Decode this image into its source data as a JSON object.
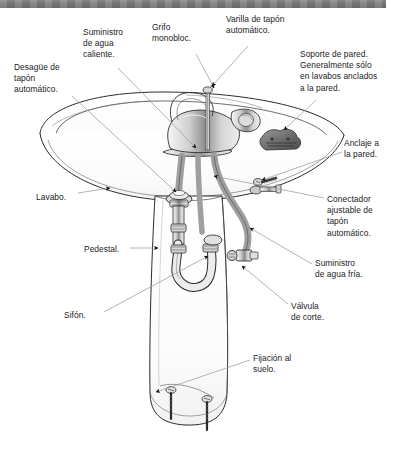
{
  "document": {
    "type": "technical-illustration",
    "subject": "Lavabo con pedestal",
    "language": "es",
    "header_band_color": "#797979",
    "line_color": "#8d8d8d",
    "ink_color": "#1b1b1b"
  },
  "labels": [
    {
      "id": "desague",
      "text": "Desagüe de\ntapón\nautomático.",
      "x": 14,
      "y": 62
    },
    {
      "id": "suministro_caliente",
      "text": "Suministro\nde agua\ncaliente.",
      "x": 83,
      "y": 27
    },
    {
      "id": "grifo",
      "text": "Grifo\nmonobloc.",
      "x": 152,
      "y": 22
    },
    {
      "id": "varilla",
      "text": "Varilla de tapón\nautomático.",
      "x": 226,
      "y": 14
    },
    {
      "id": "soporte",
      "text": "Soporte de pared.\nGeneralmente sólo\nen lavabos anclados\na la pared.",
      "x": 300,
      "y": 49
    },
    {
      "id": "anclaje",
      "text": "Anclaje a\nla pared.",
      "x": 344,
      "y": 138
    },
    {
      "id": "lavabo",
      "text": "Lavabo.",
      "x": 36,
      "y": 192
    },
    {
      "id": "conectador",
      "text": "Conectador\najustable de\ntapón\nautomático.",
      "x": 327,
      "y": 194
    },
    {
      "id": "pedestal",
      "text": "Pedestal.",
      "x": 84,
      "y": 244
    },
    {
      "id": "suministro_fria",
      "text": "Suministro\nde agua fría.",
      "x": 315,
      "y": 258
    },
    {
      "id": "valvula",
      "text": "Válvula\nde corte.",
      "x": 291,
      "y": 301
    },
    {
      "id": "sifon",
      "text": "Sifón.",
      "x": 64,
      "y": 310
    },
    {
      "id": "fijacion",
      "text": "Fijación al\nsuelo.",
      "x": 253,
      "y": 353
    }
  ],
  "parts": [
    {
      "id": "basin",
      "name": "Lavabo (basin bowl)"
    },
    {
      "id": "pedestal",
      "name": "Pedestal column"
    },
    {
      "id": "monobloc-faucet",
      "name": "Grifo monobloc"
    },
    {
      "id": "pop-up-rod",
      "name": "Varilla de tapón automático"
    },
    {
      "id": "waste-drain",
      "name": "Desagüe de tapón automático"
    },
    {
      "id": "p-trap",
      "name": "Sifón"
    },
    {
      "id": "hot-supply-hose",
      "name": "Suministro de agua caliente"
    },
    {
      "id": "cold-supply-hose",
      "name": "Suministro de agua fría"
    },
    {
      "id": "stop-valve",
      "name": "Válvula de corte"
    },
    {
      "id": "wall-bracket",
      "name": "Soporte de pared"
    },
    {
      "id": "wall-anchor",
      "name": "Anclaje a la pared"
    },
    {
      "id": "floor-screws",
      "name": "Fijación al suelo"
    }
  ]
}
